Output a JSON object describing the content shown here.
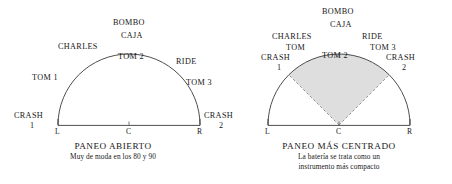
{
  "figure": {
    "background_color": "#ffffff",
    "line_color": "#3a3a3a",
    "wedge_fill": "#dedede",
    "wedge_stroke": "#8a8a8a"
  },
  "panels": [
    {
      "id": "paneo-abierto",
      "caption_title": "PANEO ABIERTO",
      "caption_subtitle_lines": [
        "Muy de moda en los 80 y 90"
      ],
      "axis": {
        "left": "L",
        "center": "C",
        "right": "R"
      },
      "has_wedge": false,
      "labels": [
        {
          "text": "CRASH",
          "x": 14,
          "y": 112
        },
        {
          "text": "1",
          "x": 30,
          "y": 122
        },
        {
          "text": "TOM 1",
          "x": 32,
          "y": 74
        },
        {
          "text": "CHARLES",
          "x": 58,
          "y": 43
        },
        {
          "text": "BOMBO",
          "x": 113,
          "y": 19
        },
        {
          "text": "CAJA",
          "x": 121,
          "y": 32
        },
        {
          "text": "TOM 2",
          "x": 118,
          "y": 53
        },
        {
          "text": "RIDE",
          "x": 176,
          "y": 58
        },
        {
          "text": "TOM 3",
          "x": 186,
          "y": 79
        },
        {
          "text": "CRASH",
          "x": 208,
          "y": 112
        },
        {
          "text": "2",
          "x": 222,
          "y": 122
        }
      ]
    },
    {
      "id": "paneo-mas-centrado",
      "caption_title": "PANEO MÁS CENTRADO",
      "caption_subtitle_lines": [
        "La batería se trata como un",
        "instrumento más compacto"
      ],
      "axis": {
        "left": "L",
        "center": "C",
        "right": "R"
      },
      "has_wedge": true,
      "labels": [
        {
          "text": "BOMBO",
          "x": 104,
          "y": 8
        },
        {
          "text": "CAJA",
          "x": 110,
          "y": 21
        },
        {
          "text": "CHARLES",
          "x": 62,
          "y": 33
        },
        {
          "text": "TOM",
          "x": 74,
          "y": 44
        },
        {
          "text": "CRASH",
          "x": 45,
          "y": 54
        },
        {
          "text": "1",
          "x": 61,
          "y": 64
        },
        {
          "text": "RIDE",
          "x": 148,
          "y": 33
        },
        {
          "text": "TOM 3",
          "x": 152,
          "y": 44
        },
        {
          "text": "CRASH",
          "x": 165,
          "y": 54
        },
        {
          "text": "2",
          "x": 180,
          "y": 64
        },
        {
          "text": "TOM 2",
          "x": 104,
          "y": 52
        }
      ]
    }
  ]
}
